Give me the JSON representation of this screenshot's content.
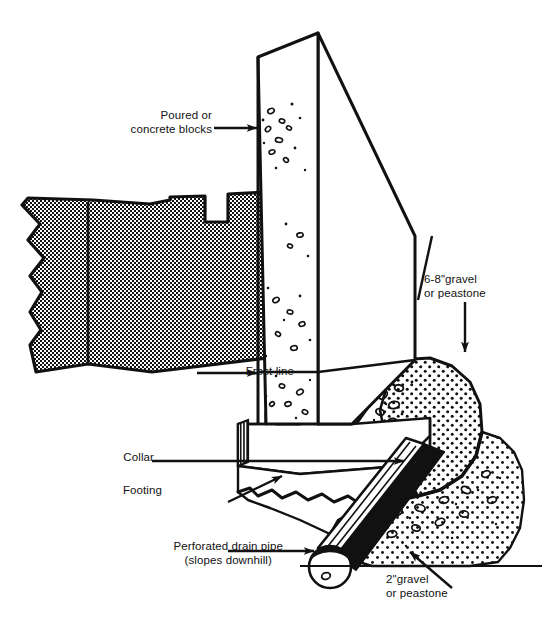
{
  "figure": {
    "colors": {
      "ink": "#111111",
      "paper": "#ffffff",
      "soil_fill": "#000000",
      "gravel_fill": "#000000"
    }
  },
  "labels": {
    "poured_or_concrete_blocks": "Poured or\nconcrete blocks",
    "frost_line": "Frost line",
    "collar": "Collar",
    "footing": "Footing",
    "perforated_drain_pipe": "Perforated drain pipe\n(slopes downhill)",
    "gravel_6_8": "6-8\"gravel\nor peastone",
    "gravel_2": "2\"gravel\nor peastone"
  },
  "parts": {
    "wall": "foundation-wall",
    "soil": "soil-mass",
    "footing": "footing-block",
    "collar": "collar-notch",
    "upper_gravel": "upper-gravel-mound",
    "lower_gravel": "lower-gravel-bed",
    "pipe": "perforated-drain-pipe",
    "frost_line": "frost-line"
  }
}
